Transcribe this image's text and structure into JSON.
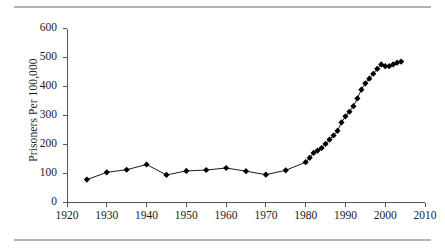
{
  "figure": {
    "has_top_rule": true,
    "has_bottom_rule": true,
    "rule_color": "#b3b3b3",
    "background": "#ffffff",
    "ink_color": "#000000"
  },
  "chart_data": {
    "type": "line",
    "title": "",
    "subtitle": "",
    "xlabel": "",
    "ylabel": "Prisoners Per 100,000",
    "xlim": [
      1920,
      2010
    ],
    "ylim": [
      0,
      600
    ],
    "xticks": [
      1920,
      1930,
      1940,
      1950,
      1960,
      1970,
      1980,
      1990,
      2000,
      2010
    ],
    "yticks": [
      0,
      100,
      200,
      300,
      400,
      500,
      600
    ],
    "xtick_labels": [
      "1920",
      "1930",
      "1940",
      "1950",
      "1960",
      "1970",
      "1980",
      "1990",
      "2000",
      "2010"
    ],
    "ytick_labels": [
      "0",
      "100",
      "200",
      "300",
      "400",
      "500",
      "600"
    ],
    "grid": false,
    "legend": null,
    "legend_position": "none",
    "marker": "diamond",
    "marker_size": 3.1,
    "line_width": 0.9,
    "series": [
      {
        "name": "Prisoners Per 100,000",
        "x": [
          1925,
          1930,
          1935,
          1940,
          1945,
          1950,
          1955,
          1960,
          1965,
          1970,
          1975,
          1980,
          1981,
          1982,
          1983,
          1984,
          1985,
          1986,
          1987,
          1988,
          1989,
          1990,
          1991,
          1992,
          1993,
          1994,
          1995,
          1996,
          1997,
          1998,
          1999,
          2000,
          2001,
          2002,
          2003,
          2004
        ],
        "values": [
          79,
          104,
          113,
          131,
          95,
          109,
          112,
          119,
          108,
          96,
          111,
          139,
          154,
          171,
          179,
          188,
          202,
          217,
          231,
          247,
          276,
          297,
          313,
          332,
          359,
          389,
          411,
          427,
          444,
          461,
          476,
          470,
          470,
          476,
          482,
          486
        ]
      }
    ]
  }
}
